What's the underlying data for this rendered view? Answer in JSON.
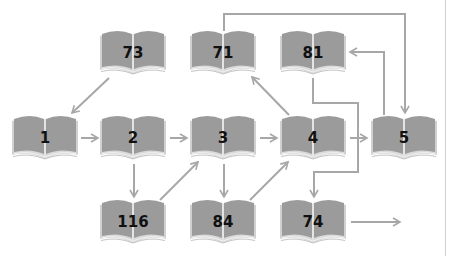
{
  "diagram": {
    "type": "flow-of-books",
    "colors": {
      "book_fill": "#9b9b9b",
      "book_page_edge": "#d6d6d6",
      "arrow": "#a7a7a7",
      "label": "#111111",
      "background": "#ffffff"
    },
    "nodes": [
      {
        "id": "n73",
        "label": "73",
        "cx": 133,
        "cy": 52
      },
      {
        "id": "n71",
        "label": "71",
        "cx": 223,
        "cy": 52
      },
      {
        "id": "n81",
        "label": "81",
        "cx": 313,
        "cy": 52
      },
      {
        "id": "n1",
        "label": "1",
        "cx": 45,
        "cy": 137
      },
      {
        "id": "n2",
        "label": "2",
        "cx": 133,
        "cy": 137
      },
      {
        "id": "n3",
        "label": "3",
        "cx": 223,
        "cy": 137
      },
      {
        "id": "n4",
        "label": "4",
        "cx": 313,
        "cy": 137
      },
      {
        "id": "n5",
        "label": "5",
        "cx": 404,
        "cy": 137
      },
      {
        "id": "n116",
        "label": "116",
        "cx": 133,
        "cy": 221
      },
      {
        "id": "n84",
        "label": "84",
        "cx": 223,
        "cy": 221
      },
      {
        "id": "n74",
        "label": "74",
        "cx": 313,
        "cy": 221
      }
    ],
    "edges": [
      {
        "from": "73",
        "to": "1"
      },
      {
        "from": "1",
        "to": "2"
      },
      {
        "from": "2",
        "to": "3"
      },
      {
        "from": "2",
        "to": "116"
      },
      {
        "from": "116",
        "to": "3"
      },
      {
        "from": "3",
        "to": "4"
      },
      {
        "from": "3",
        "to": "84"
      },
      {
        "from": "84",
        "to": "4"
      },
      {
        "from": "4",
        "to": "71"
      },
      {
        "from": "4",
        "to": "5"
      },
      {
        "from": "71",
        "to": "5"
      },
      {
        "from": "5",
        "to": "81"
      },
      {
        "from": "81",
        "to": "74"
      },
      {
        "from": "74",
        "to": "(continues)"
      }
    ]
  }
}
